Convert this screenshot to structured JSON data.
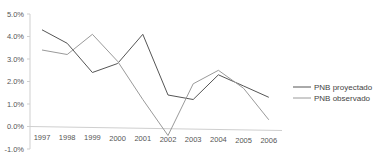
{
  "chart_data": {
    "type": "line",
    "title": "",
    "xlabel": "",
    "ylabel": "",
    "x": [
      "1997",
      "1998",
      "1999",
      "2000",
      "2001",
      "2002",
      "2003",
      "2004",
      "2005",
      "2006"
    ],
    "yticks": [
      "5.0%",
      "4.0%",
      "3.0%",
      "2.0%",
      "1.0%",
      "0.0%",
      "-1.0%"
    ],
    "ylim": [
      -1.0,
      5.0
    ],
    "grid": false,
    "legend_position": "right",
    "series": [
      {
        "name": "PNB proyectado",
        "color": "#555555",
        "values": [
          4.3,
          3.7,
          2.4,
          2.8,
          4.1,
          1.4,
          1.2,
          2.3,
          1.8,
          1.3
        ]
      },
      {
        "name": "PNB observado",
        "color": "#9a9a9a",
        "values": [
          3.4,
          3.2,
          4.1,
          2.9,
          1.2,
          -0.4,
          1.9,
          2.5,
          1.7,
          0.3
        ]
      }
    ]
  },
  "legend": {
    "items": [
      {
        "label": "PNB proyectado"
      },
      {
        "label": "PNB observado"
      }
    ]
  }
}
